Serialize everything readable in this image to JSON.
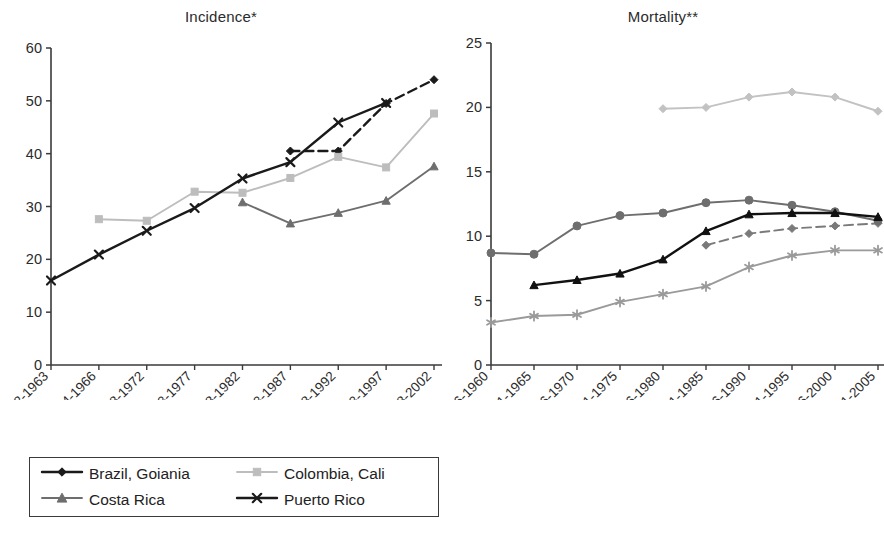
{
  "figure": {
    "panels": [
      "incidence",
      "mortality"
    ]
  },
  "chart_data": [
    {
      "id": "incidence",
      "type": "line",
      "title": "Incidence*",
      "xlabel": "",
      "ylabel": "",
      "ylim": [
        0,
        60
      ],
      "yticks": [
        0,
        10,
        20,
        30,
        40,
        50,
        60
      ],
      "grid": false,
      "legend_position": "below",
      "categories": [
        "1962-1963",
        "1964-1966",
        "1968-1972",
        "1973-1977",
        "1978-1982",
        "1983-1987",
        "1988-1992",
        "1993-1997",
        "1998-2002"
      ],
      "series": [
        {
          "name": "Brazil, Goiania",
          "marker": "diamond",
          "line": "dashed",
          "color": "#1a1a1a",
          "values": [
            null,
            null,
            null,
            null,
            null,
            40.5,
            40.5,
            49.5,
            54.0
          ]
        },
        {
          "name": "Colombia, Cali",
          "marker": "square",
          "line": "solid",
          "color": "#bdbdbd",
          "values": [
            null,
            27.6,
            27.3,
            32.8,
            32.6,
            35.4,
            39.4,
            37.4,
            47.6
          ]
        },
        {
          "name": "Costa Rica",
          "marker": "triangle",
          "line": "solid",
          "color": "#6e6e6e",
          "values": [
            null,
            null,
            null,
            null,
            30.8,
            26.8,
            28.8,
            31.1,
            37.6
          ]
        },
        {
          "name": "Puerto Rico",
          "marker": "cross",
          "line": "solid",
          "color": "#1a1a1a",
          "values": [
            16.0,
            20.9,
            25.4,
            29.7,
            35.3,
            38.4,
            45.9,
            49.6,
            null
          ]
        }
      ]
    },
    {
      "id": "mortality",
      "type": "line",
      "title": "Mortality**",
      "xlabel": "",
      "ylabel": "",
      "ylim": [
        0,
        25
      ],
      "yticks": [
        0,
        5,
        10,
        15,
        20,
        25
      ],
      "grid": false,
      "legend_position": "below",
      "categories": [
        "1956-1960",
        "1961-1965",
        "1966-1970",
        "1971-1975",
        "1976-1980",
        "1981-1985",
        "1986-1990",
        "1991-1995",
        "1996-2000",
        "2001-2005"
      ],
      "series": [
        {
          "name": "Argentina",
          "marker": "diamond",
          "line": "solid",
          "color": "#c2c2c2",
          "values": [
            null,
            null,
            null,
            null,
            19.9,
            20.0,
            20.8,
            21.2,
            20.8,
            19.7
          ]
        },
        {
          "name": "Brazil",
          "marker": "diamond",
          "line": "dashed",
          "color": "#7a7a7a",
          "values": [
            null,
            null,
            null,
            null,
            null,
            9.3,
            10.2,
            10.6,
            10.8,
            11.0
          ]
        },
        {
          "name": "Chile",
          "marker": "circle",
          "line": "solid",
          "color": "#6e6e6e",
          "values": [
            8.7,
            8.6,
            10.8,
            11.6,
            11.8,
            12.6,
            12.8,
            12.4,
            11.9,
            11.2
          ]
        },
        {
          "name": "Costa Rica",
          "marker": "triangle",
          "line": "solid",
          "color": "#111111",
          "values": [
            null,
            6.2,
            6.6,
            7.1,
            8.2,
            10.4,
            11.7,
            11.8,
            11.8,
            11.5
          ]
        },
        {
          "name": "Mexico",
          "marker": "asterisk",
          "line": "solid",
          "color": "#9a9a9a",
          "values": [
            3.3,
            3.8,
            3.9,
            4.9,
            5.5,
            6.1,
            7.6,
            8.5,
            8.9,
            8.9
          ]
        }
      ]
    }
  ],
  "legends": {
    "incidence": [
      {
        "label": "Brazil, Goiania",
        "color": "#1a1a1a",
        "marker": "diamond",
        "line": "solid"
      },
      {
        "label": "Colombia, Cali",
        "color": "#bdbdbd",
        "marker": "square",
        "line": "solid"
      },
      {
        "label": "Costa Rica",
        "color": "#6e6e6e",
        "marker": "triangle",
        "line": "solid"
      },
      {
        "label": "Puerto Rico",
        "color": "#1a1a1a",
        "marker": "cross",
        "line": "solid"
      }
    ],
    "mortality": [
      {
        "label": "Argentina",
        "color": "#c2c2c2",
        "marker": "diamond",
        "line": "solid"
      },
      {
        "label": "Brazil",
        "color": "#7a7a7a",
        "marker": "diamond",
        "line": "dashed"
      },
      {
        "label": "Chile",
        "color": "#6e6e6e",
        "marker": "circle",
        "line": "solid"
      },
      {
        "label": "Costa Rica",
        "color": "#111111",
        "marker": "triangle",
        "line": "solid"
      },
      {
        "label": "Mexico",
        "color": "#9a9a9a",
        "marker": "asterisk",
        "line": "solid"
      }
    ]
  }
}
